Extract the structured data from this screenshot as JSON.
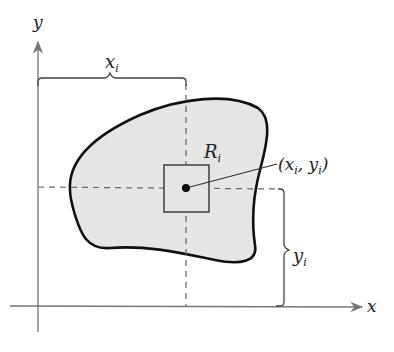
{
  "diagram": {
    "axes": {
      "x_label": "x",
      "y_label": "y"
    },
    "labels": {
      "xi_main": "x",
      "xi_sub": "i",
      "yi_main": "y",
      "yi_sub": "i",
      "region_main": "R",
      "region_sub": "i",
      "point_open": "(x",
      "point_sub1": "i",
      "point_mid": ", y",
      "point_sub2": "i",
      "point_close": ")"
    },
    "colors": {
      "region_fill": "#e6e6e6",
      "stroke": "#111111",
      "axis": "#777777",
      "dash": "#666666"
    }
  }
}
